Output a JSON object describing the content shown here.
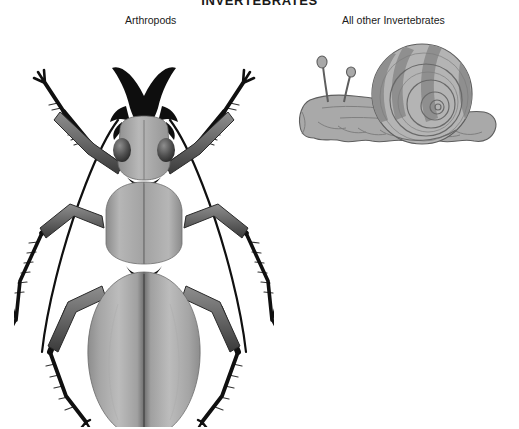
{
  "figure": {
    "title": "INVERTEBRATES",
    "background_color": "#ffffff",
    "width": 519,
    "height": 429
  },
  "panels": [
    {
      "id": "arthropods",
      "label": "Arthropods",
      "illustration": "ground-beetle-dorsal-view",
      "illustration_alt": "Grayscale dorsal illustration of a ground beetle with long antennae, mandibles, six spiny legs and oval elytra"
    },
    {
      "id": "all-other-invertebrates",
      "label": "All other Invertebrates",
      "illustration": "land-snail-side-view",
      "illustration_alt": "Grayscale side illustration of a land snail with a banded spiral shell, two eyestalk tentacles and a muscular foot"
    }
  ],
  "colors": {
    "ink": "#1a1a1a",
    "beetle_body_light": "#bdbdbd",
    "beetle_body_mid": "#9a9a9a",
    "beetle_body_dark": "#6e6e6e",
    "beetle_leg_dark": "#121212",
    "snail_body": "#a9a9a9",
    "snail_shell_light": "#b4b4b4",
    "snail_shell_band": "#8a8a8a",
    "outline": "#4a4a4a"
  }
}
